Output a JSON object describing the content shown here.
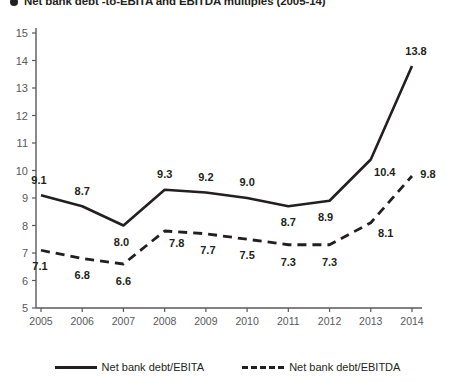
{
  "title": "Net bank debt -to-EBITA and EBITDA multiples (2005-14)",
  "chart_data": {
    "type": "line",
    "title": "Net bank debt -to-EBITA and EBITDA multiples (2005-14)",
    "xlabel": "",
    "ylabel": "",
    "categories": [
      "2005",
      "2006",
      "2007",
      "2008",
      "2009",
      "2010",
      "2011",
      "2012",
      "2013",
      "2014"
    ],
    "ylim": [
      5,
      15
    ],
    "yticks": [
      5,
      6,
      7,
      8,
      9,
      10,
      11,
      12,
      13,
      14,
      15
    ],
    "grid": false,
    "legend_position": "bottom",
    "series": [
      {
        "name": "Net bank debt/EBITA",
        "style": "solid",
        "color": "#231f20",
        "values": [
          9.1,
          8.7,
          8.0,
          9.3,
          9.2,
          9.0,
          8.7,
          8.9,
          10.4,
          13.8
        ],
        "labels": [
          "9.1",
          "8.7",
          "8.0",
          "9.3",
          "9.2",
          "9.0",
          "8.7",
          "8.9",
          "10.4",
          "13.8"
        ]
      },
      {
        "name": "Net bank debt/EBITDA",
        "style": "dashed",
        "color": "#231f20",
        "values": [
          7.1,
          6.8,
          6.6,
          7.8,
          7.7,
          7.5,
          7.3,
          7.3,
          8.1,
          9.8
        ],
        "labels": [
          "7.1",
          "6.8",
          "6.6",
          "7.8",
          "7.7",
          "7.5",
          "7.3",
          "7.3",
          "8.1",
          "9.8"
        ]
      }
    ]
  }
}
